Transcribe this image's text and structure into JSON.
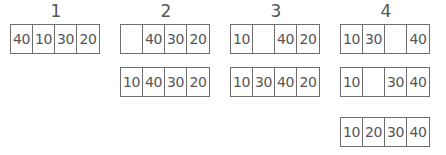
{
  "steps": [
    {
      "label": "1",
      "arrays": [
        [
          "40",
          "10",
          "30",
          "20"
        ]
      ]
    },
    {
      "label": "2",
      "arrays": [
        [
          "",
          "40",
          "30",
          "20"
        ],
        [
          "10",
          "40",
          "30",
          "20"
        ]
      ]
    },
    {
      "label": "3",
      "arrays": [
        [
          "10",
          "",
          "40",
          "20"
        ],
        [
          "10",
          "30",
          "40",
          "20"
        ]
      ]
    },
    {
      "label": "4",
      "arrays": [
        [
          "10",
          "30",
          "",
          "40"
        ],
        [
          "10",
          "",
          "30",
          "40"
        ],
        [
          "10",
          "20",
          "30",
          "40"
        ]
      ]
    }
  ]
}
